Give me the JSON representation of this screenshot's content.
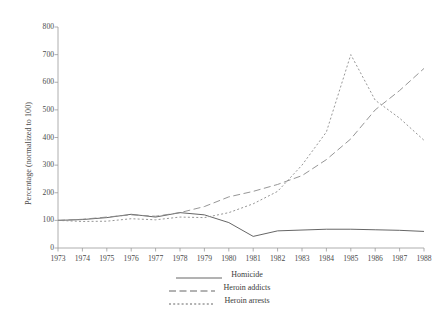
{
  "chart_data": {
    "type": "line",
    "title": "",
    "xlabel": "",
    "ylabel": "Percentage (normalized to 100)",
    "x": [
      1973,
      1974,
      1975,
      1976,
      1977,
      1978,
      1979,
      1980,
      1981,
      1982,
      1983,
      1984,
      1985,
      1986,
      1987,
      1988
    ],
    "xtick_labels": [
      "1973",
      "1974",
      "1975",
      "1976",
      "1977",
      "1978",
      "1979",
      "1980",
      "1981",
      "1982",
      "1983",
      "1984",
      "1985",
      "1986",
      "1987",
      "1988"
    ],
    "ytick_labels": [
      "0",
      "100",
      "200",
      "300",
      "400",
      "500",
      "600",
      "700",
      "800"
    ],
    "yticks": [
      0,
      100,
      200,
      300,
      400,
      500,
      600,
      700,
      800
    ],
    "xlim": [
      1973,
      1988
    ],
    "ylim": [
      0,
      800
    ],
    "grid": false,
    "legend_position": "bottom-center",
    "series": [
      {
        "name": "Homicide",
        "style": "solid",
        "color": "#555555",
        "values": [
          100,
          103,
          110,
          122,
          112,
          128,
          120,
          92,
          42,
          62,
          65,
          68,
          68,
          66,
          64,
          60
        ]
      },
      {
        "name": "Heroin addicts",
        "style": "long-dash",
        "color": "#8a8a8a",
        "values": [
          100,
          104,
          112,
          120,
          115,
          128,
          150,
          185,
          205,
          230,
          262,
          320,
          395,
          500,
          570,
          650
        ]
      },
      {
        "name": "Heroin arrests",
        "style": "short-dash",
        "color": "#8a8a8a",
        "values": [
          100,
          96,
          97,
          106,
          102,
          112,
          110,
          128,
          160,
          205,
          300,
          420,
          700,
          535,
          470,
          390
        ]
      }
    ]
  },
  "legend": {
    "items": [
      {
        "label": "Homicide",
        "style": "solid"
      },
      {
        "label": "Heroin addicts",
        "style": "long-dash"
      },
      {
        "label": "Heroin arrests",
        "style": "short-dash"
      }
    ]
  },
  "axes": {
    "y_title": "Percentage (normalized to 100)"
  }
}
